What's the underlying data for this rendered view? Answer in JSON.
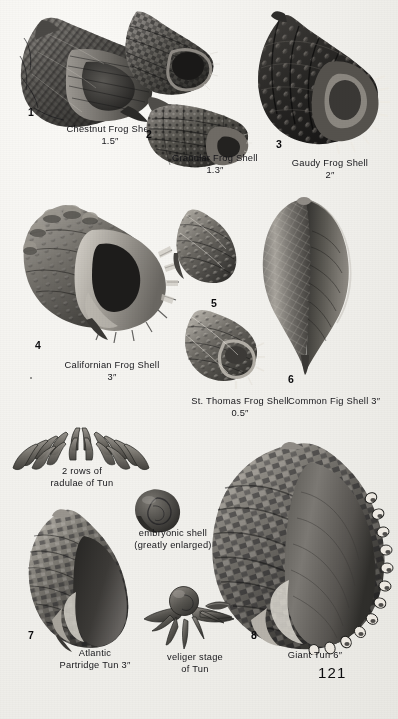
{
  "page": {
    "page_number": "121",
    "background_hex": "#f1f0ec",
    "ink_hex": "#16161a",
    "plate_type": "halftone-photographic-plate"
  },
  "figures": [
    {
      "number": "1",
      "name": "Chestnut Frog Shell",
      "size": "1.5″",
      "caption": "Chestnut Frog Shell\n1.5″"
    },
    {
      "number": "2",
      "name": "Granular Frog Shell",
      "size": "1.3″",
      "caption": "Granular Frog Shell\n1.3″"
    },
    {
      "number": "3",
      "name": "Gaudy Frog Shell",
      "size": "2″",
      "caption": "Gaudy Frog Shell\n2″"
    },
    {
      "number": "4",
      "name": "Californian Frog Shell",
      "size": "3″",
      "caption": "Californian Frog Shell\n3″"
    },
    {
      "number": "5",
      "name": "St. Thomas Frog Shell",
      "size": "0.5″",
      "caption": "St. Thomas Frog Shell\n0.5″"
    },
    {
      "number": "6",
      "name": "Common Fig Shell",
      "size": "3″",
      "caption": "Common Fig Shell 3″"
    },
    {
      "number": "7",
      "name": "Atlantic Partridge Tun",
      "size": "3″",
      "caption": "Atlantic\nPartridge Tun 3″"
    },
    {
      "number": "8",
      "name": "Giant Tun",
      "size": "6″",
      "caption": "Giant Tun 6″"
    }
  ],
  "anatomy": [
    {
      "id": "radulae",
      "caption": "2 rows of\nradulae of Tun"
    },
    {
      "id": "embryonic-shell",
      "caption": "embryonic shell\n(greatly enlarged)"
    },
    {
      "id": "veliger",
      "caption": "veliger stage\nof Tun"
    }
  ]
}
